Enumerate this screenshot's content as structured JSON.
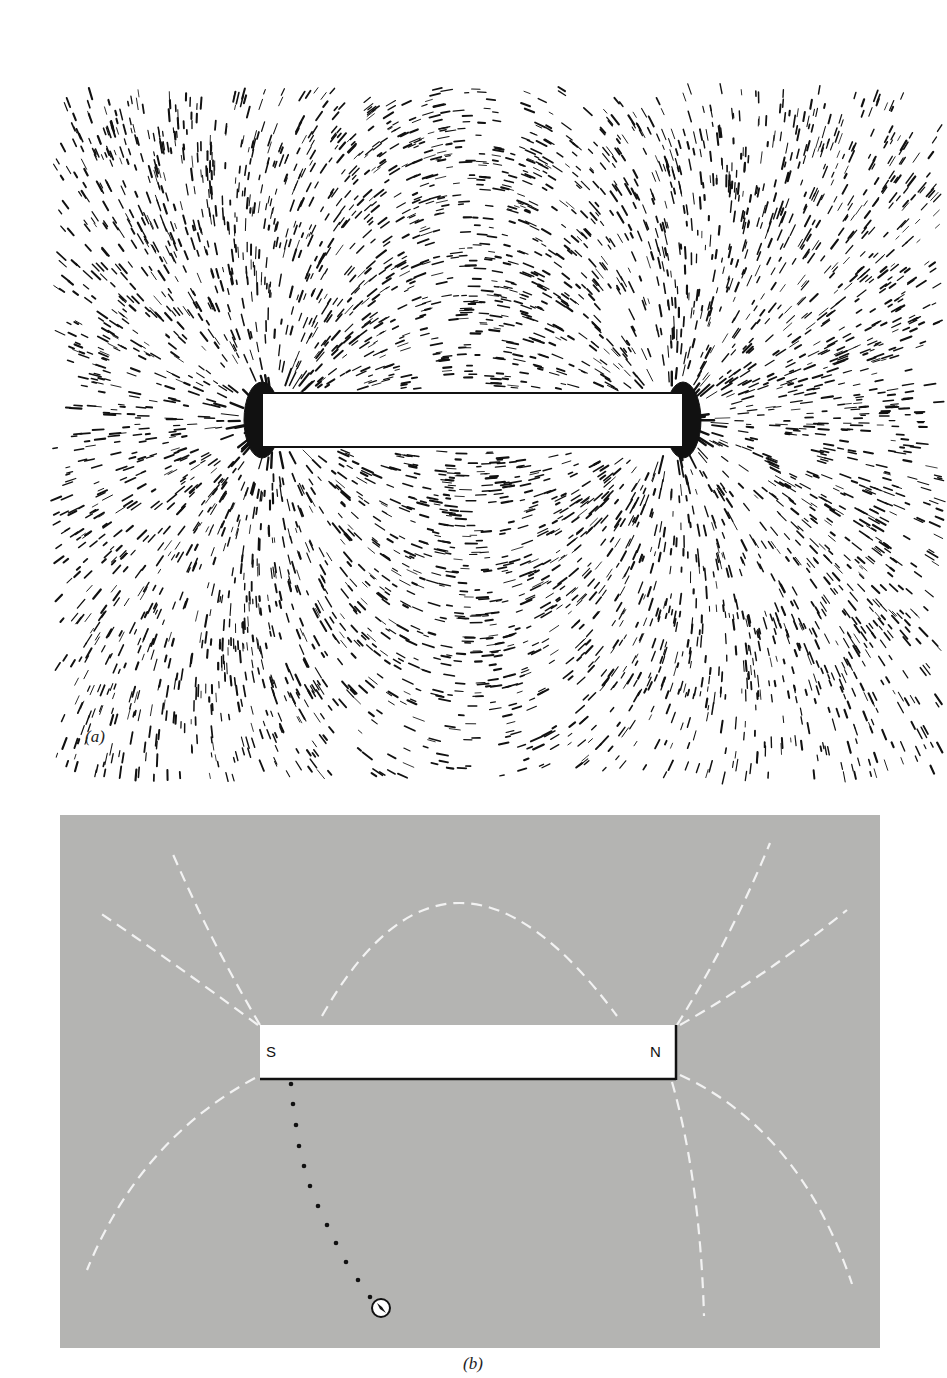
{
  "figure": {
    "panel_a": {
      "caption": "(a)",
      "description": "Iron filings aligned along magnetic field lines around a bar magnet",
      "magnet": {
        "x": 262,
        "y": 393,
        "width": 421,
        "height": 54
      },
      "filings_color": "#111111",
      "background": "#ffffff"
    },
    "panel_b": {
      "caption": "(b)",
      "background": "#b4b4b2",
      "field_line_color": "#f2f2f2",
      "magnet": {
        "fill": "#ffffff",
        "shadow": "#111111",
        "south_label": "S",
        "north_label": "N"
      },
      "field_lines": [
        "M 260 1025 Q 210 940 172 852",
        "M 258 1025 Q 170 960 97 911",
        "M 322 1016 Q 450 790 617 1016",
        "M 677 1025 Q 730 940 770 843",
        "M 680 1025 Q 760 980 847 910",
        "M 255 1078 Q 140 1140 87 1270",
        "M 672 1082 Q 700 1180 704 1316",
        "M 680 1075 Q 800 1130 852 1284"
      ],
      "compass_path_dots": [
        [
          291,
          1084
        ],
        [
          293,
          1104
        ],
        [
          296,
          1125
        ],
        [
          299,
          1146
        ],
        [
          304,
          1166
        ],
        [
          310,
          1186
        ],
        [
          318,
          1206
        ],
        [
          327,
          1225
        ],
        [
          336,
          1243
        ],
        [
          346,
          1262
        ],
        [
          358,
          1280
        ],
        [
          370,
          1297
        ]
      ],
      "compass": {
        "x": 381,
        "y": 1308,
        "r": 9
      }
    }
  }
}
